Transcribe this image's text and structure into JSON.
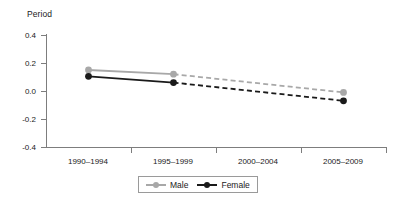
{
  "chart_data": {
    "type": "line",
    "title": "",
    "xlabel": "Period",
    "ylabel": "",
    "axis_title": "Period",
    "categories": [
      "1990–1994",
      "1995–1999",
      "2000–2004",
      "2005–2009"
    ],
    "ylim": [
      -0.4,
      0.4
    ],
    "yticks": [
      0.4,
      0.2,
      0.0,
      -0.2,
      -0.4
    ],
    "ytick_labels": [
      "0.4",
      "0.2",
      "0.0",
      "-0.2",
      "-0.4"
    ],
    "grid": false,
    "legend_position": "bottom-center",
    "series": [
      {
        "name": "Male",
        "color": "#a8a8a8",
        "marker": "circle",
        "values": [
          0.15,
          0.12,
          null,
          -0.01
        ],
        "segments": [
          {
            "from": "1990–1994",
            "to": "1995–1999",
            "style": "solid"
          },
          {
            "from": "1995–1999",
            "to": "2005–2009",
            "style": "dashed"
          }
        ]
      },
      {
        "name": "Female",
        "color": "#1a1a1a",
        "marker": "circle",
        "values": [
          0.105,
          0.06,
          null,
          -0.07
        ],
        "segments": [
          {
            "from": "1990–1994",
            "to": "1995–1999",
            "style": "solid"
          },
          {
            "from": "1995–1999",
            "to": "2005–2009",
            "style": "dashed"
          }
        ]
      }
    ]
  },
  "axis": {
    "title": "Period",
    "y_labels": [
      "0.4",
      "0.2",
      "0.0",
      "-0.2",
      "-0.4"
    ],
    "x_labels": [
      "1990–1994",
      "1995–1999",
      "2000–2004",
      "2005–2009"
    ]
  },
  "legend": {
    "items": [
      {
        "label": "Male",
        "color": "#a8a8a8"
      },
      {
        "label": "Female",
        "color": "#1a1a1a"
      }
    ]
  },
  "colors": {
    "male": "#a8a8a8",
    "female": "#1a1a1a",
    "axis": "#7d7d7d",
    "background": "#ffffff"
  }
}
